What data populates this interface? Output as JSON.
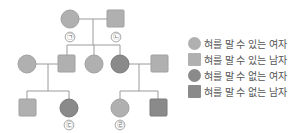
{
  "colors": {
    "can_roll": "#b0b0b0",
    "cannot_roll": "#8a8a8a",
    "line": "#9a9a9a"
  },
  "marks": {
    "gen1_female": "㉠",
    "gen1_male": "㉡",
    "gen3_female_left": "㉢",
    "gen3_female_right": "㉣"
  },
  "legend": [
    {
      "shape": "circle",
      "trait": "can_roll",
      "label": "혀를 말 수 있는 여자"
    },
    {
      "shape": "square",
      "trait": "can_roll",
      "label": "혀를 말 수 있는 남자"
    },
    {
      "shape": "circle",
      "trait": "cannot_roll",
      "label": "혀를 말 수 없는 여자"
    },
    {
      "shape": "square",
      "trait": "cannot_roll",
      "label": "혀를 말 수 없는 남자"
    }
  ],
  "pedigree": {
    "generation1": [
      {
        "id": "g1f",
        "sex": "female",
        "trait": "can_roll",
        "mark": "㉠"
      },
      {
        "id": "g1m",
        "sex": "male",
        "trait": "can_roll",
        "mark": "㉡"
      }
    ],
    "generation2": [
      {
        "id": "g2a",
        "sex": "female",
        "trait": "can_roll",
        "note": "spouse"
      },
      {
        "id": "g2b",
        "sex": "male",
        "trait": "can_roll"
      },
      {
        "id": "g2c",
        "sex": "female",
        "trait": "can_roll"
      },
      {
        "id": "g2d",
        "sex": "female",
        "trait": "cannot_roll"
      },
      {
        "id": "g2e",
        "sex": "male",
        "trait": "can_roll",
        "note": "spouse"
      }
    ],
    "generation3": [
      {
        "id": "g3a",
        "sex": "male",
        "trait": "can_roll"
      },
      {
        "id": "g3b",
        "sex": "female",
        "trait": "cannot_roll",
        "mark": "㉢"
      },
      {
        "id": "g3c",
        "sex": "female",
        "trait": "can_roll",
        "mark": "㉣"
      },
      {
        "id": "g3d",
        "sex": "male",
        "trait": "cannot_roll"
      }
    ]
  }
}
